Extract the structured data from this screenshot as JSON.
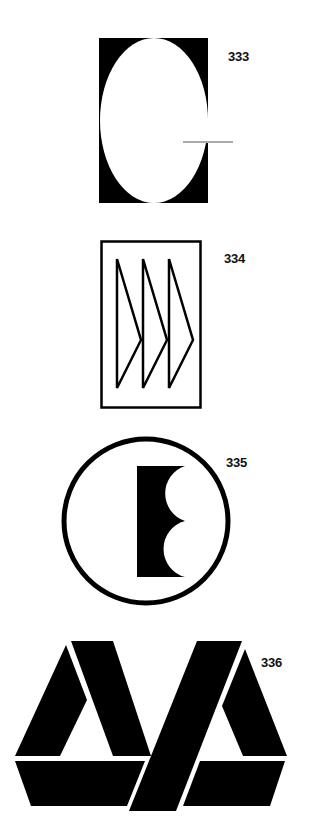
{
  "page": {
    "background": "#ffffff",
    "ink_color": "#000000"
  },
  "logos": [
    {
      "number": "333",
      "description": "Black rectangle with white vertical ellipse cut-out and a thin horizontal line at the right edge break"
    },
    {
      "number": "334",
      "description": "Outlined rectangle containing three outlined right-pointing arrowhead triangles"
    },
    {
      "number": "335",
      "description": "Circle outline containing a black block letter E-shape with two semicircular cut-outs"
    },
    {
      "number": "336",
      "description": "Two interlocking triangular A-shapes built from black parallelogram segments"
    }
  ]
}
